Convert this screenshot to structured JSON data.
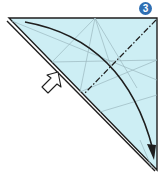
{
  "diagram": {
    "type": "origami-fold-step",
    "step_number": "3",
    "top_text_fragment": "",
    "colors": {
      "paper_fill": "#cdeef4",
      "outline": "#1e1e1e",
      "crease": "#9bb7bf",
      "badge": "#2f6fb3",
      "arrow": "#1e1e1e",
      "push_arrow_fill": "#ffffff"
    },
    "elements": [
      {
        "name": "paper-triangle",
        "description": "right triangle of folded paper, light blue"
      },
      {
        "name": "valley-fold-line",
        "style": "dash-dot",
        "description": "fold line from top-right corner toward lower-left"
      },
      {
        "name": "fold-arrow",
        "style": "curved",
        "description": "curved arrow from upper-left to bottom corner"
      },
      {
        "name": "push-arrow",
        "style": "hollow",
        "description": "hollow arrow pointing at left edge (squash/push)"
      },
      {
        "name": "crease-lines",
        "description": "thin gray existing crease lines"
      }
    ]
  }
}
